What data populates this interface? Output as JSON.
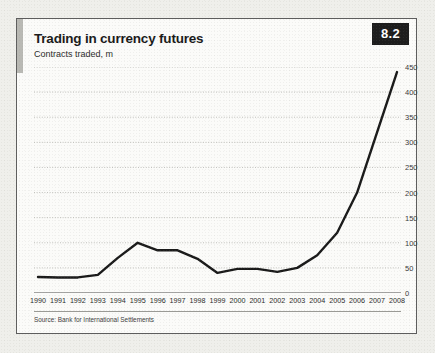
{
  "card": {
    "title": "Trading in currency futures",
    "subtitle": "Contracts traded, m",
    "badge": "8.2",
    "source": "Source: Bank for International Settlements",
    "colors": {
      "line": "#1a1a1a",
      "badge_bg": "#1d1d1d",
      "badge_text": "#ffffff",
      "accent_bar": "#b9b9b4",
      "card_bg": "#fbfbf9",
      "card_border": "#5d5d5d",
      "page_bg": "#efefeb",
      "gridline": "#b0b0ab",
      "axis": "#4a4a4a"
    }
  },
  "chart_data": {
    "type": "line",
    "title": "Trading in currency futures",
    "subtitle": "Contracts traded, m",
    "xlabel": "",
    "ylabel": "Contracts traded, m",
    "categories": [
      "1990",
      "1991",
      "1992",
      "1993",
      "1994",
      "1995",
      "1996",
      "1997",
      "1998",
      "1999",
      "2000",
      "2001",
      "2002",
      "2003",
      "2004",
      "2005",
      "2006",
      "2007",
      "2008"
    ],
    "values": [
      32,
      31,
      31,
      36,
      70,
      100,
      85,
      85,
      68,
      40,
      48,
      48,
      42,
      50,
      75,
      120,
      200,
      320,
      440
    ],
    "ylim": [
      0,
      450
    ],
    "yticks": [
      0,
      50,
      100,
      150,
      200,
      250,
      300,
      350,
      400,
      450
    ],
    "ytick_labels": [
      "0",
      "50",
      "100",
      "150",
      "200",
      "250",
      "300",
      "350",
      "400",
      "450"
    ],
    "grid": true,
    "legend": false,
    "series": [
      {
        "name": "Contracts traded, m",
        "values": [
          32,
          31,
          31,
          36,
          70,
          100,
          85,
          85,
          68,
          40,
          48,
          48,
          42,
          50,
          75,
          120,
          200,
          320,
          440
        ]
      }
    ]
  }
}
